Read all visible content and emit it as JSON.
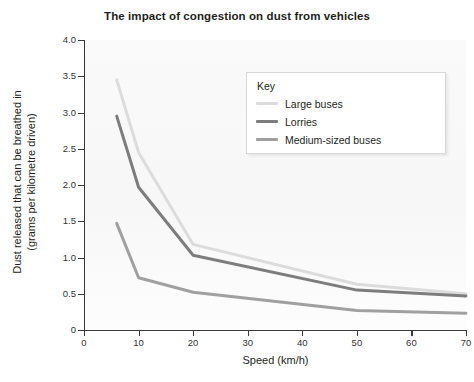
{
  "chart_data": {
    "type": "line",
    "title": "The impact of congestion on dust from vehicles",
    "xlabel": "Speed (km/h)",
    "ylabel_line1": "Dust released that can be breathed in",
    "ylabel_line2": "(grams per kilometre driven)",
    "xlim": [
      0,
      70
    ],
    "ylim": [
      0,
      4.0
    ],
    "xticks": [
      "0",
      "10",
      "20",
      "30",
      "40",
      "50",
      "60",
      "70"
    ],
    "xtick_values": [
      0,
      10,
      20,
      30,
      40,
      50,
      60,
      70
    ],
    "yticks": [
      "0",
      "0.5",
      "1.0",
      "1.5",
      "2.0",
      "2.5",
      "3.0",
      "3.5",
      "4.0"
    ],
    "ytick_values": [
      0,
      0.5,
      1.0,
      1.5,
      2.0,
      2.5,
      3.0,
      3.5,
      4.0
    ],
    "grid": false,
    "legend_position": "upper-right-inside",
    "legend_title": "Key",
    "x": [
      6,
      10,
      20,
      50,
      70
    ],
    "series": [
      {
        "name": "Large buses",
        "color": "#dcdcdc",
        "values": [
          3.45,
          2.45,
          1.18,
          0.63,
          0.5
        ]
      },
      {
        "name": "Lorries",
        "color": "#7d7d7d",
        "values": [
          2.95,
          1.97,
          1.03,
          0.55,
          0.47
        ]
      },
      {
        "name": "Medium-sized buses",
        "color": "#a0a0a0",
        "values": [
          1.47,
          0.72,
          0.52,
          0.27,
          0.23
        ]
      }
    ]
  },
  "legend": {
    "title": "Key",
    "items": [
      {
        "label": "Large buses",
        "color": "#dcdcdc"
      },
      {
        "label": "Lorries",
        "color": "#7d7d7d"
      },
      {
        "label": "Medium-sized buses",
        "color": "#a0a0a0"
      }
    ]
  }
}
